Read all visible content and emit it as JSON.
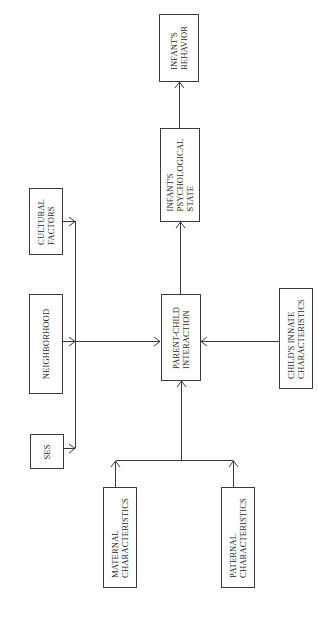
{
  "diagram": {
    "title": "",
    "nodes": {
      "infant_behavior": {
        "lines": [
          "INFANT'S",
          "BEHAVIOR"
        ]
      },
      "infant_psych_state": {
        "lines": [
          "INFANT'S",
          "PSYCHOLOGICAL",
          "STATE"
        ]
      },
      "parent_child_interaction": {
        "lines": [
          "PARENT-CHILD",
          "INTERACTION"
        ]
      },
      "cultural_factors": {
        "lines": [
          "CULTURAL",
          "FACTORS"
        ]
      },
      "neighborhood": {
        "lines": [
          "NEIGHBORHOOD"
        ]
      },
      "ses": {
        "lines": [
          "SES"
        ]
      },
      "childs_innate": {
        "lines": [
          "CHILD'S INNATE",
          "CHARACTERISTICS"
        ]
      },
      "maternal": {
        "lines": [
          "MATERNAL",
          "CHARACTERISTICS"
        ]
      },
      "paternal": {
        "lines": [
          "PATERNAL",
          "CHARACTERISTICS"
        ]
      }
    },
    "edges": [
      {
        "from": "cultural_factors",
        "to": "parent_child_interaction"
      },
      {
        "from": "neighborhood",
        "to": "parent_child_interaction"
      },
      {
        "from": "ses",
        "to": "parent_child_interaction"
      },
      {
        "from": "childs_innate",
        "to": "parent_child_interaction"
      },
      {
        "from": "maternal",
        "to": "parent_child_interaction"
      },
      {
        "from": "paternal",
        "to": "parent_child_interaction"
      },
      {
        "from": "parent_child_interaction",
        "to": "infant_psych_state"
      },
      {
        "from": "infant_psych_state",
        "to": "infant_behavior"
      }
    ],
    "colors": {
      "stroke": "#3a3a3a",
      "text": "#2a2a2a",
      "background": "#ffffff"
    }
  }
}
